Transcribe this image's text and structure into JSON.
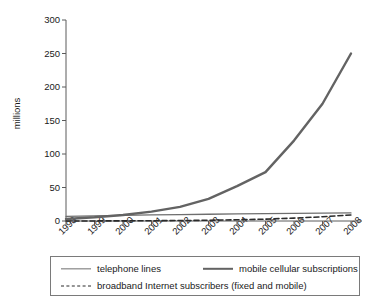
{
  "chart_data": {
    "type": "line",
    "title": "",
    "subtitle": "",
    "xlabel": "",
    "ylabel": "millions",
    "x": [
      "1998",
      "1999",
      "2000",
      "2001",
      "2002",
      "2003",
      "2004",
      "2005",
      "2006",
      "2007",
      "2008"
    ],
    "xtick_labels": [
      "1998",
      "1999",
      "2000",
      "2001",
      "2002",
      "2003",
      "2004",
      "2005",
      "2006",
      "2007",
      "2008"
    ],
    "ytick_labels": [
      "0",
      "50",
      "100",
      "150",
      "200",
      "250",
      "300"
    ],
    "ytick_values": [
      0,
      50,
      100,
      150,
      200,
      250,
      300
    ],
    "ylim": [
      0,
      300
    ],
    "grid": false,
    "legend_position": "bottom",
    "series": [
      {
        "name": "telephone lines",
        "style": "solid-thin",
        "color": "#6e6e6e",
        "values": [
          7.0,
          7.7,
          8.4,
          9.0,
          9.6,
          10.1,
          10.6,
          11.0,
          11.4,
          11.8,
          12.1
        ]
      },
      {
        "name": "mobile cellular subscriptions",
        "style": "solid-thick",
        "color": "#636363",
        "values": [
          3.0,
          5.5,
          9.0,
          14.0,
          21.0,
          33.0,
          52.0,
          73.0,
          120.0,
          175.0,
          250.0
        ]
      },
      {
        "name": "broadband Internet subscribers (fixed and mobile)",
        "style": "dashed",
        "color": "#2a2a2a",
        "values": [
          0.0,
          0.1,
          0.2,
          0.4,
          0.7,
          1.1,
          1.8,
          2.8,
          4.3,
          6.3,
          9.0
        ]
      }
    ]
  },
  "legend": {
    "items": [
      {
        "label": "telephone lines"
      },
      {
        "label": "mobile cellular subscriptions"
      },
      {
        "label": "broadband Internet subscribers (fixed and mobile)"
      }
    ]
  },
  "axis": {
    "y_title": "millions"
  }
}
